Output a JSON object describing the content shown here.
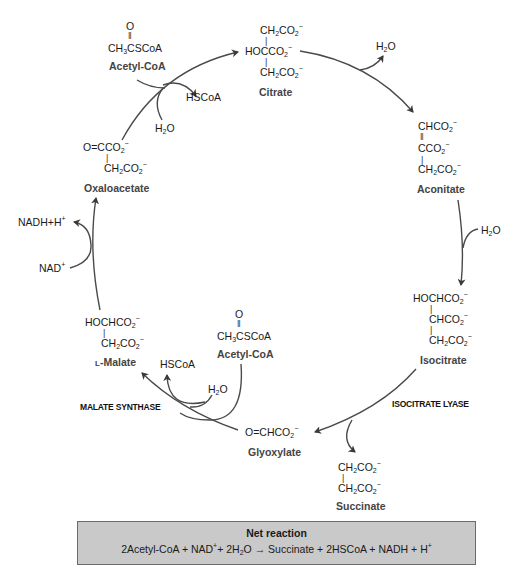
{
  "cycle": {
    "citrate": {
      "name": "Citrate",
      "lines": [
        "CH2CO2−",
        "HOCCO2−",
        "CH2CO2−"
      ]
    },
    "aconitate": {
      "name": "Aconitate",
      "lines": [
        "CHCO2−",
        "CCO2−",
        "CH2CO2−"
      ]
    },
    "isocitrate": {
      "name": "Isocitrate",
      "lines": [
        "HOCHCO2−",
        "CHCO2−",
        "CH2CO2−"
      ]
    },
    "glyoxylate": {
      "name": "Glyoxylate",
      "lines": [
        "O=CHCO2−"
      ]
    },
    "succinate": {
      "name": "Succinate",
      "lines": [
        "CH2CO2−",
        "CH2CO2−"
      ]
    },
    "malate": {
      "name": "L-Malate",
      "lines": [
        "HOCHCO2−",
        "CH2CO2−"
      ]
    },
    "oxaloacetate": {
      "name": "Oxaloacetate",
      "lines": [
        "O=CCO2−",
        "CH2CO2−"
      ]
    },
    "acetyl_coa_top": {
      "name": "Acetyl-CoA",
      "lines": [
        "O",
        "CH3CSCoA"
      ]
    },
    "acetyl_coa_bottom": {
      "name": "Acetyl-CoA",
      "lines": [
        "O",
        "CH3CSCoA"
      ]
    }
  },
  "cofactors": {
    "hscoa_top": "HSCoA",
    "h2o_top": "H2O",
    "h2o_citrate": "H2O",
    "h2o_aconitate": "H2O",
    "nadh": "NADH+H+",
    "nad": "NAD+",
    "hscoa_bottom": "HSCoA",
    "h2o_bottom": "H2O"
  },
  "enzymes": {
    "isocitrate_lyase": "ISOCITRATE LYASE",
    "malate_synthase": "MALATE SYNTHASE"
  },
  "net_reaction": {
    "title": "Net reaction",
    "equation": "2Acetyl-CoA + NAD+ + 2H2O → Succinate + 2HSCoA + NADH + H+"
  },
  "colors": {
    "arrow": "#4a4a4a",
    "box_fill": "#c9c9c9",
    "box_border": "#6a6a6a",
    "name_text": "#444444"
  }
}
